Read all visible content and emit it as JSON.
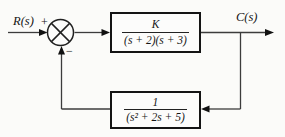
{
  "diagram": {
    "input_label": "R(s)",
    "input_sign": "+",
    "output_label": "C(s)",
    "feedback_sign": "−",
    "forward_block": {
      "numerator": "K",
      "denominator": "(s + 2)(s + 3)"
    },
    "feedback_block": {
      "numerator": "1",
      "denominator": "(s² + 2s + 5)"
    },
    "colors": {
      "background": "#fbfbf9",
      "line": "#3c3c3c",
      "block_border": "#141414",
      "arrowhead": "#111111",
      "text": "#141414"
    }
  }
}
